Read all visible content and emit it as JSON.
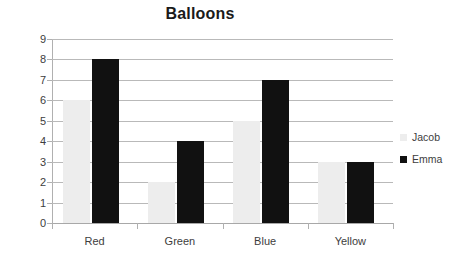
{
  "chart_data": {
    "type": "bar",
    "title": "Balloons",
    "xlabel": "",
    "ylabel": "",
    "categories": [
      "Red",
      "Green",
      "Blue",
      "Yellow"
    ],
    "series": [
      {
        "name": "Jacob",
        "color": "#ededed",
        "values": [
          6,
          2,
          5,
          3
        ]
      },
      {
        "name": "Emma",
        "color": "#111111",
        "values": [
          8,
          4,
          7,
          3
        ]
      }
    ],
    "ylim": [
      0,
      9
    ],
    "ytick_step": 1,
    "yticks": [
      "9",
      "8",
      "7",
      "6",
      "5",
      "4",
      "3",
      "2",
      "1",
      "0"
    ],
    "grid": true,
    "legend_position": "right"
  },
  "legend": {
    "entries": [
      {
        "label": "Jacob",
        "swatch": "jacob-swatch-icon"
      },
      {
        "label": "Emma",
        "swatch": "emma-swatch-icon"
      }
    ]
  }
}
